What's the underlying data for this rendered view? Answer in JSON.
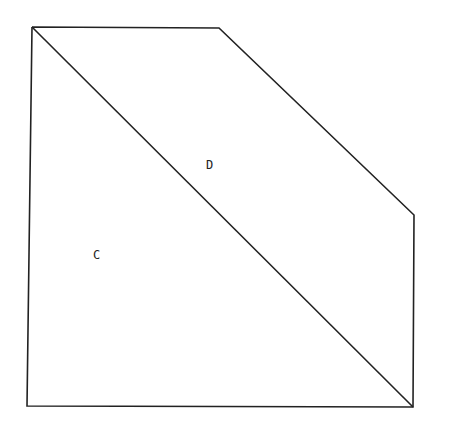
{
  "diagram": {
    "stroke_color": "#222222",
    "background": "#ffffff",
    "outline_points": "32,27 219,28 414,215 413,407 27,406 32,27",
    "diagonal": {
      "x1": 32,
      "y1": 27,
      "x2": 413,
      "y2": 407
    },
    "labels": [
      {
        "id": "D",
        "text": "D",
        "x": 206,
        "y": 169
      },
      {
        "id": "C",
        "text": "C",
        "x": 93,
        "y": 259
      }
    ]
  }
}
